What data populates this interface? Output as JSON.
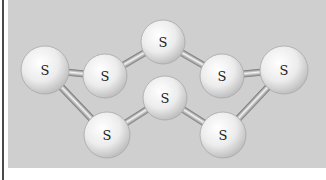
{
  "diagram": {
    "colors": {
      "panel": "#cfcfcf",
      "atom_light": "#fafafa",
      "atom_dark": "#bdbdbd",
      "bond_light": "#f0f0f0",
      "bond_dark": "#7a7a7a",
      "frame": "#4a4a4a"
    },
    "atoms": [
      {
        "id": "a1",
        "label": "S",
        "x": 45,
        "y": 70,
        "r": 24
      },
      {
        "id": "a2",
        "label": "S",
        "x": 105,
        "y": 76,
        "r": 22
      },
      {
        "id": "a3",
        "label": "S",
        "x": 163,
        "y": 42,
        "r": 22
      },
      {
        "id": "a4",
        "label": "S",
        "x": 222,
        "y": 76,
        "r": 22
      },
      {
        "id": "a5",
        "label": "S",
        "x": 284,
        "y": 70,
        "r": 24
      },
      {
        "id": "a6",
        "label": "S",
        "x": 165,
        "y": 98,
        "r": 22
      },
      {
        "id": "a7",
        "label": "S",
        "x": 107,
        "y": 135,
        "r": 23
      },
      {
        "id": "a8",
        "label": "S",
        "x": 223,
        "y": 135,
        "r": 23
      }
    ],
    "bonds": [
      [
        "a1",
        "a2"
      ],
      [
        "a2",
        "a3"
      ],
      [
        "a3",
        "a4"
      ],
      [
        "a4",
        "a5"
      ],
      [
        "a1",
        "a7"
      ],
      [
        "a7",
        "a6"
      ],
      [
        "a6",
        "a8"
      ],
      [
        "a8",
        "a5"
      ]
    ]
  }
}
